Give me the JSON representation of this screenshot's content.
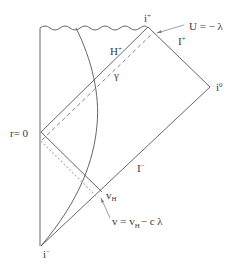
{
  "diagram": {
    "type": "penrose-diagram",
    "labels": {
      "i_plus": "i",
      "i_plus_sup": "+",
      "i_minus": "i",
      "i_minus_sup": "−",
      "i_zero": "i",
      "i_zero_sup": "0",
      "scri_plus": "I",
      "scri_plus_sup": "+",
      "scri_minus": "I",
      "scri_minus_sup": "−",
      "horizon": "H",
      "horizon_sup": "+",
      "gamma": "γ",
      "r_zero": "r= 0",
      "v_h": "v",
      "v_h_sub": "H",
      "u_eq": "U =  − λ",
      "v_eq_prefix": "v  =  v",
      "v_eq_sub": "H",
      "v_eq_suffix": "−  c  λ"
    },
    "colors": {
      "line": "#555555",
      "dashed": "#777777",
      "dotted": "#bbbbbb",
      "text": "#3a3a3a",
      "background": "#ffffff"
    }
  }
}
